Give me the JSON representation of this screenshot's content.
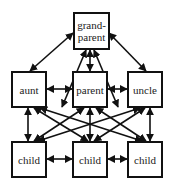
{
  "nodes": {
    "grandparent": {
      "label": "grand-\nparent",
      "line1": "grand-",
      "line2": "parent"
    },
    "aunt": {
      "label": "aunt"
    },
    "parent": {
      "label": "parent"
    },
    "uncle": {
      "label": "uncle"
    },
    "child1": {
      "label": "child"
    },
    "child2": {
      "label": "child"
    },
    "child3": {
      "label": "child"
    }
  },
  "edges": [
    [
      "grandparent",
      "aunt"
    ],
    [
      "grandparent",
      "parent"
    ],
    [
      "grandparent",
      "uncle"
    ],
    [
      "aunt",
      "parent"
    ],
    [
      "parent",
      "uncle"
    ],
    [
      "aunt",
      "child1"
    ],
    [
      "aunt",
      "child2"
    ],
    [
      "aunt",
      "child3"
    ],
    [
      "parent",
      "child1"
    ],
    [
      "parent",
      "child2"
    ],
    [
      "parent",
      "child3"
    ],
    [
      "uncle",
      "child1"
    ],
    [
      "uncle",
      "child2"
    ],
    [
      "uncle",
      "child3"
    ],
    [
      "child1",
      "child2"
    ],
    [
      "child2",
      "child3"
    ]
  ],
  "colors": {
    "stroke": "#111111",
    "background": "#ffffff"
  }
}
